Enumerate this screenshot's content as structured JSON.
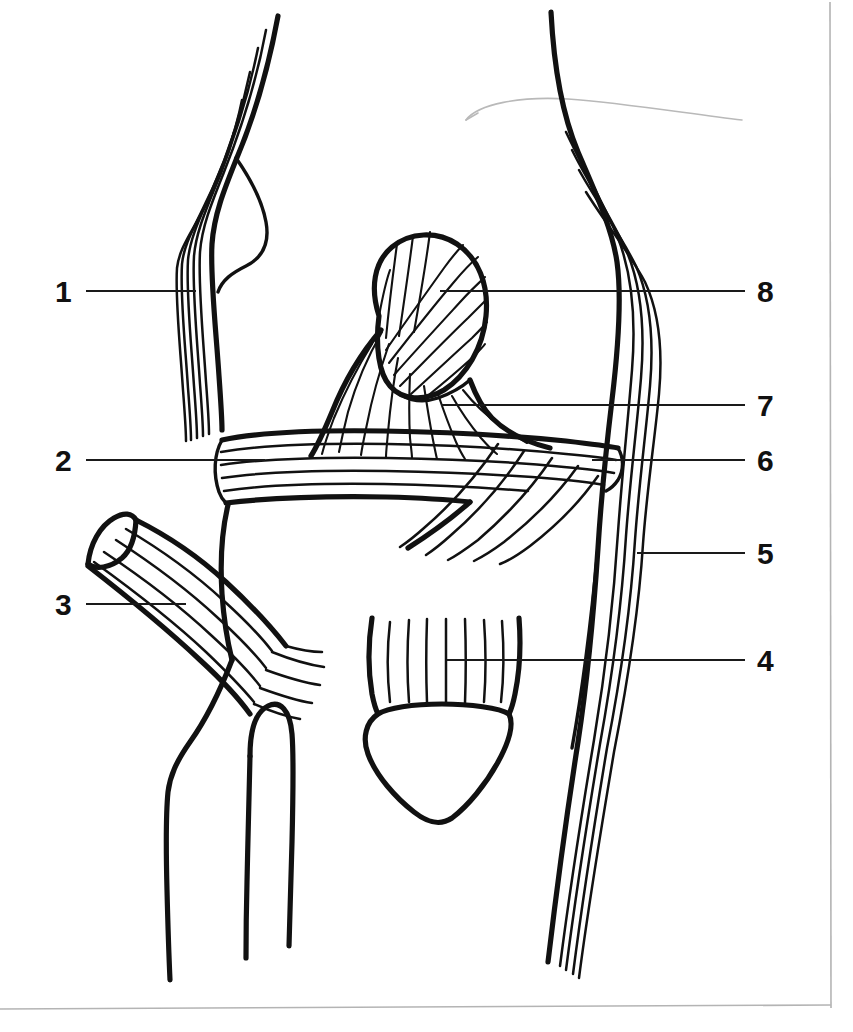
{
  "figure": {
    "view": "anterior",
    "background_color": "#ffffff",
    "ink_color": "#111111",
    "frame_color": "#b4b4b4",
    "width": 853,
    "height": 1032
  },
  "labels": [
    {
      "id": "label-1",
      "number": "1",
      "side": "left",
      "text_x": 55,
      "text_y": 277,
      "leader": {
        "x1": 86,
        "y1": 291,
        "x2": 196,
        "y2": 291
      }
    },
    {
      "id": "label-2",
      "number": "2",
      "side": "left",
      "text_x": 55,
      "text_y": 446,
      "leader": {
        "x1": 86,
        "y1": 460,
        "x2": 265,
        "y2": 460
      }
    },
    {
      "id": "label-3",
      "number": "3",
      "side": "left",
      "text_x": 55,
      "text_y": 590,
      "leader": {
        "x1": 86,
        "y1": 604,
        "x2": 186,
        "y2": 604
      }
    },
    {
      "id": "label-4",
      "number": "4",
      "side": "right",
      "text_x": 757,
      "text_y": 646,
      "leader": {
        "x1": 447,
        "y1": 660,
        "x2": 745,
        "y2": 660
      }
    },
    {
      "id": "label-5",
      "number": "5",
      "side": "right",
      "text_x": 757,
      "text_y": 539,
      "leader": {
        "x1": 637,
        "y1": 553,
        "x2": 745,
        "y2": 553
      }
    },
    {
      "id": "label-6",
      "number": "6",
      "side": "right",
      "text_x": 757,
      "text_y": 446,
      "leader": {
        "x1": 592,
        "y1": 460,
        "x2": 745,
        "y2": 460
      }
    },
    {
      "id": "label-7",
      "number": "7",
      "side": "right",
      "text_x": 757,
      "text_y": 391,
      "leader": {
        "x1": 441,
        "y1": 405,
        "x2": 745,
        "y2": 405
      }
    },
    {
      "id": "label-8",
      "number": "8",
      "side": "right",
      "text_x": 757,
      "text_y": 277,
      "leader": {
        "x1": 440,
        "y1": 291,
        "x2": 745,
        "y2": 291
      }
    }
  ],
  "structures": [
    {
      "name": "patella",
      "label_ref": "8"
    },
    {
      "name": "medial-thigh-outline",
      "label_ref": "1"
    },
    {
      "name": "medial-collateral-ligament-band",
      "label_ref": "2"
    },
    {
      "name": "reflected-muscle-stump",
      "label_ref": "3"
    },
    {
      "name": "patellar-ligament",
      "label_ref": "4"
    },
    {
      "name": "lateral-leg-outline",
      "label_ref": "5"
    },
    {
      "name": "lateral-collateral-ligament-band",
      "label_ref": "6"
    },
    {
      "name": "oblique-ligament-fibers",
      "label_ref": "7"
    }
  ]
}
